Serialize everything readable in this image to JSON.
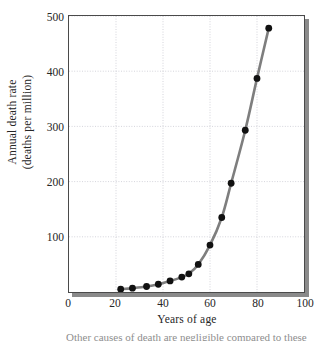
{
  "figure": {
    "background_color": "#ffffff",
    "frame_color": "#4a4a4a",
    "shadow_color": "#8a8a8a",
    "caption_partial": "Other causes of death are negligible compared to these"
  },
  "chart_data": {
    "type": "line",
    "title": "",
    "xlabel": "Years of age",
    "ylabel": "Annual death rate (deaths per million)",
    "ylabel_line1": "Annual death rate",
    "ylabel_line2": "(deaths per million)",
    "xlim": [
      0,
      100
    ],
    "ylim": [
      0,
      500
    ],
    "xticks": [
      0,
      20,
      40,
      60,
      80,
      100
    ],
    "yticks": [
      100,
      200,
      300,
      400,
      500
    ],
    "xtick_labels": [
      "0",
      "20",
      "40",
      "60",
      "80",
      "100"
    ],
    "ytick_labels": [
      "100",
      "200",
      "300",
      "400",
      "500"
    ],
    "grid": true,
    "grid_style": "dotted",
    "grid_color": "#c9c9d2",
    "legend": "none",
    "line_color": "#7e7e7e",
    "line_width": 2.6,
    "marker": "circle",
    "marker_color": "#111111",
    "marker_size": 3.4,
    "x": [
      22,
      27,
      33,
      38,
      43,
      48,
      51,
      55,
      60,
      65,
      69,
      75,
      80,
      85
    ],
    "y": [
      5,
      7,
      10,
      14,
      20,
      27,
      33,
      50,
      85,
      135,
      197,
      293,
      387,
      478
    ],
    "points": [
      {
        "age": 22,
        "rate": 5
      },
      {
        "age": 27,
        "rate": 7
      },
      {
        "age": 33,
        "rate": 10
      },
      {
        "age": 38,
        "rate": 14
      },
      {
        "age": 43,
        "rate": 20
      },
      {
        "age": 48,
        "rate": 27
      },
      {
        "age": 51,
        "rate": 33
      },
      {
        "age": 55,
        "rate": 50
      },
      {
        "age": 60,
        "rate": 85
      },
      {
        "age": 65,
        "rate": 135
      },
      {
        "age": 69,
        "rate": 197
      },
      {
        "age": 75,
        "rate": 293
      },
      {
        "age": 80,
        "rate": 387
      },
      {
        "age": 85,
        "rate": 478
      }
    ]
  }
}
